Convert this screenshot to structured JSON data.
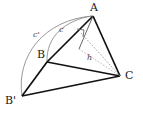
{
  "figure": {
    "width": 143,
    "height": 115,
    "background": "#ffffff"
  },
  "colors": {
    "stroke_bold": "#111111",
    "stroke_thin": "#555555",
    "stroke_arc": "#888888",
    "stroke_dashed": "#999999",
    "label": "#1a1a1a"
  },
  "vertices": [
    {
      "id": "A",
      "label": "A",
      "x": 93,
      "y": 16
    },
    {
      "id": "B",
      "label": "B",
      "x": 47,
      "y": 62
    },
    {
      "id": "Bp",
      "label": "B'",
      "x": 22,
      "y": 96
    },
    {
      "id": "C",
      "label": "C",
      "x": 120,
      "y": 76
    }
  ],
  "side_labels": [
    {
      "id": "c-prime",
      "label": "c'",
      "x": 33,
      "y": 31
    },
    {
      "id": "c",
      "label": "c",
      "x": 59,
      "y": 26
    },
    {
      "id": "h",
      "label": "h",
      "x": 87,
      "y": 54
    }
  ],
  "segments": [
    {
      "id": "A-B",
      "from": "A",
      "to": "B",
      "style": "bold"
    },
    {
      "id": "A-C",
      "from": "A",
      "to": "C",
      "style": "bold"
    },
    {
      "id": "B-C",
      "from": "B",
      "to": "C",
      "style": "bold"
    },
    {
      "id": "B-Bp",
      "from": "B",
      "to": "Bp",
      "style": "bold"
    },
    {
      "id": "Bp-C",
      "from": "Bp",
      "to": "C",
      "style": "bold"
    },
    {
      "id": "A-foot",
      "from": "A",
      "to": "foot-of-altitude",
      "style": "thin"
    },
    {
      "id": "foot-C",
      "from": "foot-of-altitude",
      "to": "C",
      "style": "dashed"
    }
  ],
  "arcs": [
    {
      "id": "arc-c-prime",
      "from": "Bp",
      "to": "A",
      "label": "c'"
    },
    {
      "id": "arc-c",
      "from": "B",
      "to": "A",
      "label": "c"
    }
  ],
  "right_angle_marker": {
    "id": "right-angle-at-altitude",
    "x": 82,
    "y": 32
  }
}
